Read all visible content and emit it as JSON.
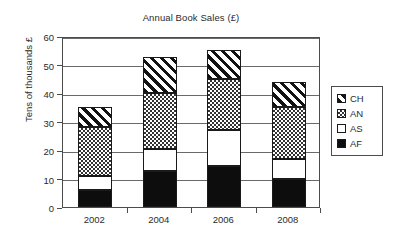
{
  "chart_data": {
    "type": "bar",
    "subtype": "stacked-column",
    "title": "Annual Book Sales (£)",
    "xlabel": "",
    "ylabel": "Tens of thousands £",
    "categories": [
      "2002",
      "2004",
      "2006",
      "2008"
    ],
    "series": [
      {
        "name": "AF",
        "values": [
          6,
          12.5,
          14.5,
          10
        ],
        "fill": "solid-black",
        "color": "#0d0d0d"
      },
      {
        "name": "AS",
        "values": [
          5,
          8,
          12.5,
          7
        ],
        "fill": "white",
        "color": "#ffffff"
      },
      {
        "name": "AN",
        "values": [
          17,
          19.5,
          18,
          18
        ],
        "fill": "stipple-checker",
        "color": "#ffffff"
      },
      {
        "name": "CH",
        "values": [
          7,
          12.5,
          10,
          9
        ],
        "fill": "diagonal-hatch",
        "color": "#ffffff"
      }
    ],
    "cumulative_tops": {
      "2002": {
        "AF": 6,
        "AS": 11,
        "AN": 28,
        "CH": 35
      },
      "2004": {
        "AF": 12.5,
        "AS": 20.5,
        "AN": 40,
        "CH": 52.5
      },
      "2006": {
        "AF": 14.5,
        "AS": 27,
        "AN": 45,
        "CH": 55
      },
      "2008": {
        "AF": 10,
        "AS": 17,
        "AN": 35,
        "CH": 44
      }
    },
    "totals": [
      35,
      52.5,
      55,
      44
    ],
    "ylim": [
      0,
      60
    ],
    "ytick_values": [
      0,
      10,
      20,
      30,
      40,
      50,
      60
    ],
    "ytick_labels": [
      "0",
      "10",
      "20",
      "30",
      "40",
      "50",
      "60"
    ],
    "grid": "horizontal",
    "legend_position": "right",
    "legend_order": [
      "CH",
      "AN",
      "AS",
      "AF"
    ]
  },
  "legend": {
    "entries": [
      {
        "label": "CH",
        "swatch": "diagonal-hatch-swatch"
      },
      {
        "label": "AN",
        "swatch": "stipple-checker-swatch"
      },
      {
        "label": "AS",
        "swatch": "white-swatch"
      },
      {
        "label": "AF",
        "swatch": "solid-black-swatch"
      }
    ]
  },
  "colors": {
    "axis": "#4c4c4c",
    "gridline": "#6a6a6a",
    "text": "#2b2b2b",
    "bar_outline": "#1a1a1a",
    "background": "#ffffff"
  }
}
